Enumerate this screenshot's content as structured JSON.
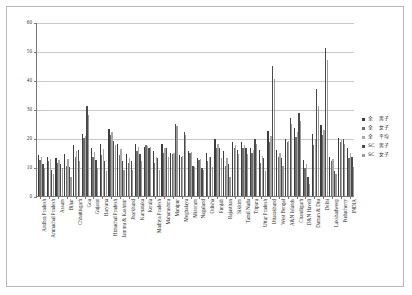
{
  "chart_data": {
    "type": "bar",
    "title": "",
    "subtitle": "",
    "xlabel": "",
    "ylabel": "",
    "ylim": [
      0,
      60
    ],
    "yticks": [
      0,
      10,
      20,
      30,
      40,
      50,
      60
    ],
    "grid": true,
    "legend_position": "right",
    "categories": [
      "Andhra Pradesh",
      "Arunachal Pradesh",
      "Assam",
      "Bihar",
      "Chhattisgarh",
      "Goa",
      "Gujarat",
      "Haryana",
      "Himachal Pradesh",
      "Jammu & Kashmir",
      "Jharkhand",
      "Karnataka",
      "Kerala",
      "Madhya Pradesh",
      "Maharashtra",
      "Manipur",
      "Meghalaya",
      "Mizoram",
      "Nagaland",
      "Odisha",
      "Punjab",
      "Rajasthan",
      "Sikkim",
      "Tamil Nadu",
      "Tripura",
      "Uttar Pradesh",
      "Uttarakhand",
      "West Bengal",
      "A&N Islands",
      "Chandigarh",
      "D&N Haveli",
      "Daman & Diu",
      "Delhi",
      "Lakshadweep",
      "Puducherry",
      "INDIA"
    ],
    "series": [
      {
        "name": "全 男子",
        "color": "#3d3d3d",
        "values": [
          14.0,
          13.5,
          13.0,
          14.5,
          17.5,
          21.5,
          16.5,
          18.0,
          23.0,
          18.0,
          14.5,
          18.0,
          17.0,
          15.5,
          18.0,
          15.0,
          14.0,
          15.5,
          13.0,
          15.0,
          19.5,
          15.5,
          18.5,
          18.5,
          16.5,
          16.0,
          22.5,
          16.0,
          19.5,
          23.5,
          12.5,
          21.5,
          24.5,
          13.5,
          20.0,
          16.5
        ]
      },
      {
        "name": "全 女子",
        "color": "#6e6e6e",
        "values": [
          12.5,
          12.0,
          11.5,
          10.5,
          13.5,
          20.0,
          13.5,
          14.0,
          21.0,
          14.0,
          11.5,
          15.5,
          17.5,
          11.5,
          15.0,
          14.5,
          13.5,
          15.0,
          12.5,
          12.0,
          16.5,
          10.5,
          16.5,
          16.5,
          15.0,
          11.5,
          18.5,
          13.5,
          18.5,
          20.5,
          9.5,
          17.5,
          21.0,
          12.0,
          18.5,
          13.0
        ]
      },
      {
        "name": "全 平均",
        "color": "#a8a8a8",
        "values": [
          13.3,
          12.8,
          12.3,
          12.6,
          15.6,
          20.8,
          15.1,
          16.2,
          22.0,
          16.1,
          13.1,
          16.8,
          17.2,
          13.6,
          16.6,
          14.8,
          13.8,
          15.3,
          12.8,
          13.6,
          18.1,
          13.2,
          17.5,
          17.5,
          15.8,
          13.9,
          20.6,
          14.8,
          19.0,
          22.1,
          11.1,
          19.6,
          22.8,
          12.8,
          19.3,
          14.8
        ]
      },
      {
        "name": "SC 男子",
        "color": "#4a4a4a",
        "values": [
          11.0,
          9.0,
          11.0,
          10.0,
          16.0,
          31.0,
          12.5,
          12.0,
          19.0,
          12.0,
          12.0,
          14.5,
          16.5,
          13.0,
          16.5,
          25.0,
          22.0,
          10.5,
          9.5,
          13.5,
          16.5,
          11.0,
          16.0,
          16.5,
          19.5,
          13.0,
          45.0,
          13.0,
          27.0,
          28.5,
          6.5,
          37.0,
          51.0,
          8.5,
          19.5,
          13.5
        ]
      },
      {
        "name": "SC 女子",
        "color": "#9a9a9a",
        "values": [
          9.5,
          7.5,
          9.5,
          6.5,
          12.0,
          28.0,
          9.5,
          8.5,
          17.5,
          9.0,
          9.0,
          12.0,
          17.0,
          9.0,
          13.5,
          24.0,
          21.0,
          10.0,
          9.0,
          10.0,
          13.0,
          6.5,
          14.5,
          14.5,
          18.0,
          8.5,
          40.5,
          10.5,
          25.0,
          26.0,
          4.0,
          31.0,
          47.0,
          7.5,
          18.0,
          10.0
        ]
      }
    ]
  },
  "legend": {
    "items": [
      {
        "category": "全",
        "series": "男子",
        "color": "#3d3d3d"
      },
      {
        "category": "全",
        "series": "女子",
        "color": "#6e6e6e"
      },
      {
        "category": "全",
        "series": "平均",
        "color": "#a8a8a8"
      },
      {
        "category": "SC",
        "series": "男子",
        "color": "#4a4a4a"
      },
      {
        "category": "SC",
        "series": "女子",
        "color": "#9a9a9a"
      }
    ]
  },
  "axis": {
    "y_min_label": "0",
    "y_max_label": "60"
  }
}
